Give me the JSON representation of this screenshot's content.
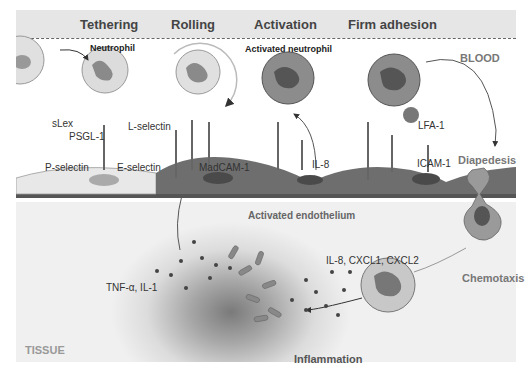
{
  "stages": {
    "tethering": "Tethering",
    "rolling": "Rolling",
    "activation": "Activation",
    "firm_adhesion": "Firm adhesion"
  },
  "regions": {
    "blood": "BLOOD",
    "tissue": "TISSUE",
    "endothelium": "Activated endothelium"
  },
  "cells": {
    "neutrophil": "Neutrophil",
    "activated_neutrophil": "Activated neutrophil"
  },
  "molecules": {
    "slex": "sLex",
    "psgl1": "PSGL-1",
    "l_selectin": "L-selectin",
    "p_selectin": "P-selectin",
    "e_selectin": "E-selectin",
    "madcam1": "MadCAM-1",
    "il8": "IL-8",
    "lfa1": "LFA-1",
    "icam1": "ICAM-1",
    "tnf_il1": "TNF-α, IL-1",
    "chemokines": "IL-8, CXCL1, CXCL2"
  },
  "processes": {
    "diapedesis": "Diapedesis",
    "chemotaxis": "Chemotaxis",
    "inflammation": "Inflammation"
  },
  "colors": {
    "header_band": "#e6e6e6",
    "resting_endothelium": "#e8e8e8",
    "activated_endothelium": "#6e6e6e",
    "neutrophil_resting": "#dcdcdc",
    "neutrophil_activated": "#8c8c8c",
    "nucleus": "#777777"
  }
}
